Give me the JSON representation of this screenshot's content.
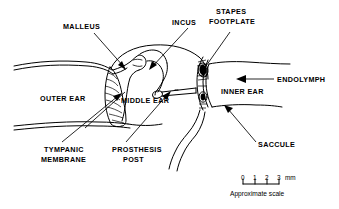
{
  "figure": {
    "type": "anatomical-line-diagram",
    "background_color": "#ffffff",
    "line_color": "#000000"
  },
  "labels": {
    "malleus": "MALLEUS",
    "incus": "INCUS",
    "stapes_footplate_line1": "STAPES",
    "stapes_footplate_line2": "FOOTPLATE",
    "endolymph": "ENDOLYMPH",
    "inner_ear": "INNER EAR",
    "middle_ear": "MIDDLE EAR",
    "outer_ear": "OUTER EAR",
    "saccule": "SACCULE",
    "tympanic_membrane_line1": "TYMPANIC",
    "tympanic_membrane_line2": "MEMBRANE",
    "prosthesis_post_line1": "PROSTHESIS",
    "prosthesis_post_line2": "POST"
  },
  "scale_bar": {
    "ticks": [
      "0",
      "1",
      "2",
      "3"
    ],
    "unit": "mm",
    "caption": "Approximate scale"
  }
}
